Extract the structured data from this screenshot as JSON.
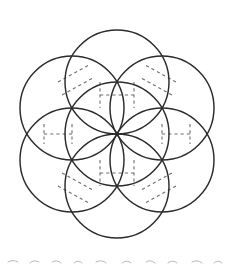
{
  "figure": {
    "title": "Seven overlapping circles in hexagonal arrangement",
    "background_color": "#ffffff",
    "stroke_color": "#2b2b2b",
    "dashed_stroke_color": "#6f6f6f",
    "artifact_color": "#b9b9b9",
    "canvas": {
      "width": 233,
      "height": 267
    },
    "center": {
      "x": 117,
      "y": 134
    },
    "radius": 52,
    "circle_count": 7,
    "circles": [
      {
        "name": "center-circle",
        "cx": 117,
        "cy": 134,
        "r": 52,
        "position": "center"
      },
      {
        "name": "top-circle",
        "cx": 117,
        "cy": 82,
        "r": 52,
        "position": "top"
      },
      {
        "name": "upper-right-circle",
        "cx": 162,
        "cy": 108,
        "r": 52,
        "position": "upper-right"
      },
      {
        "name": "lower-right-circle",
        "cx": 162,
        "cy": 160,
        "r": 52,
        "position": "lower-right"
      },
      {
        "name": "bottom-circle",
        "cx": 117,
        "cy": 186,
        "r": 52,
        "position": "bottom"
      },
      {
        "name": "lower-left-circle",
        "cx": 72,
        "cy": 160,
        "r": 52,
        "position": "lower-left"
      },
      {
        "name": "upper-left-circle",
        "cx": 72,
        "cy": 108,
        "r": 52,
        "position": "upper-left"
      }
    ],
    "dashed_chords": [
      {
        "name": "chord-upper-left-lens",
        "x1": 58,
        "y1": 82,
        "x2": 89,
        "y2": 65
      },
      {
        "name": "chord-upper-right-lens",
        "x1": 176,
        "y1": 82,
        "x2": 145,
        "y2": 65
      },
      {
        "name": "chord-left-lens-a",
        "x1": 44,
        "y1": 124,
        "x2": 44,
        "y2": 144
      },
      {
        "name": "chord-left-lens-b",
        "x1": 72,
        "y1": 124,
        "x2": 72,
        "y2": 144
      },
      {
        "name": "chord-right-lens-a",
        "x1": 162,
        "y1": 124,
        "x2": 162,
        "y2": 144
      },
      {
        "name": "chord-right-lens-b",
        "x1": 190,
        "y1": 124,
        "x2": 190,
        "y2": 144
      },
      {
        "name": "chord-lower-left-lens",
        "x1": 58,
        "y1": 186,
        "x2": 89,
        "y2": 203
      },
      {
        "name": "chord-lower-right-lens",
        "x1": 176,
        "y1": 186,
        "x2": 145,
        "y2": 203
      },
      {
        "name": "chord-center-top",
        "x1": 100,
        "y1": 95,
        "x2": 134,
        "y2": 95
      },
      {
        "name": "chord-center-bottom",
        "x1": 100,
        "y1": 173,
        "x2": 134,
        "y2": 173
      }
    ]
  }
}
